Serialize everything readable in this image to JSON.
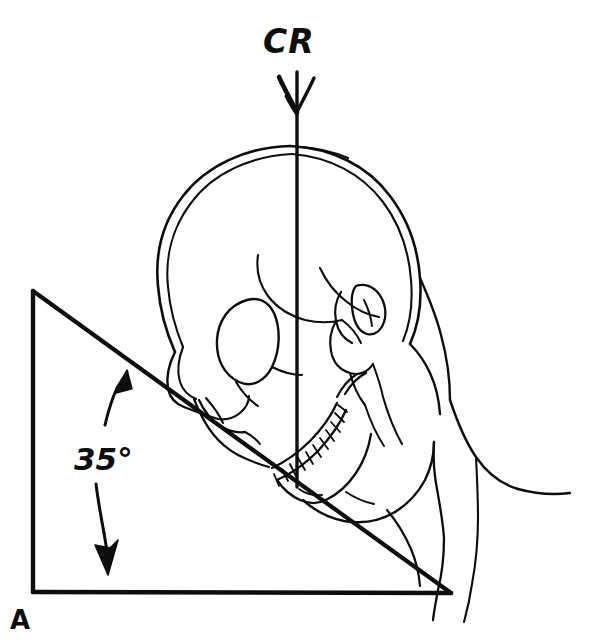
{
  "figure": {
    "background_color": "#ffffff",
    "ink_color": "#0d0d0d",
    "width": 609,
    "height": 640
  },
  "labels": {
    "central_ray": "CR",
    "angle": "35°",
    "vertex": "A"
  },
  "annotations": {
    "central_ray_direction": "downward vertical arrow",
    "angle_measure_direction": "double curved arrows spanning the angle",
    "angle_value_degrees": 35,
    "angle_vertex_label": "A"
  },
  "geometry": {
    "triangle": {
      "apex_top_left": [
        33,
        291
      ],
      "vertex_bottom_left": [
        33,
        592
      ],
      "vertex_bottom_right": [
        451,
        593
      ]
    },
    "central_ray_line": {
      "x": 297,
      "y_top": 72,
      "y_bottom": 487
    }
  },
  "parts": {
    "cranium": "cranial vault double outline",
    "orbit": "eye socket",
    "nasal": "nasal bone",
    "maxilla_teeth": "upper and lower teeth row",
    "mandible": "lower jaw",
    "ear": "external auditory meatus",
    "mastoid": "mastoid process",
    "neck": "soft tissue neck profile",
    "shoulder": "shoulder contour"
  }
}
